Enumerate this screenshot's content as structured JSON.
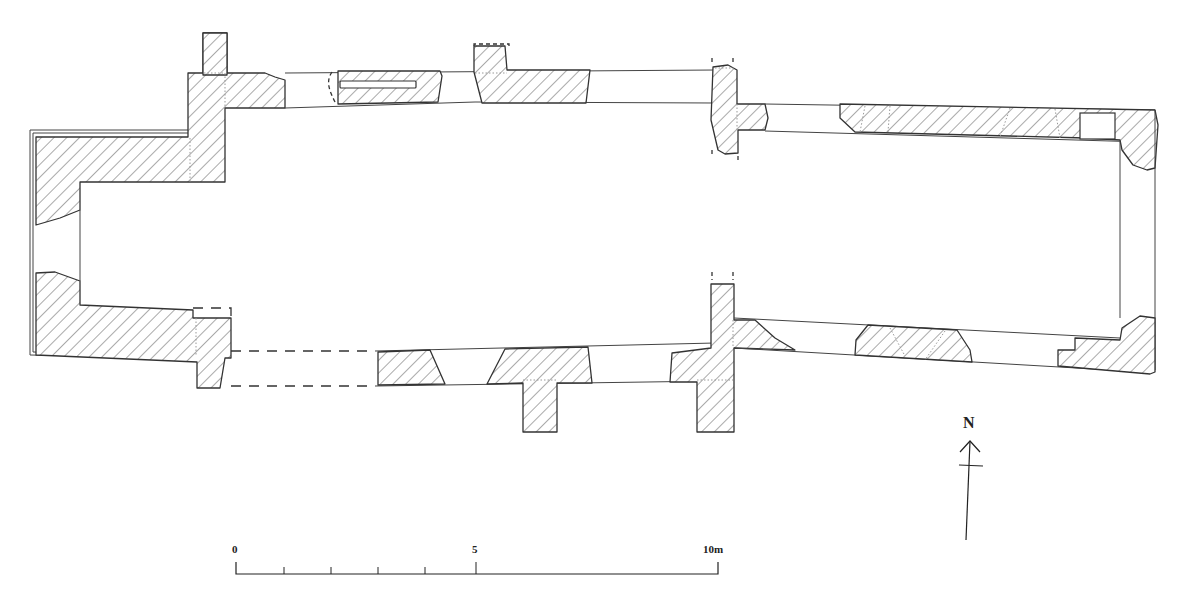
{
  "diagram": {
    "type": "architectural-floor-plan",
    "legend": {
      "hatched": "surviving wall",
      "dashed": "conjectured / robbed wall",
      "dotted": "construction joints"
    }
  },
  "north_arrow": {
    "label": "N"
  },
  "scale_bar": {
    "labels": [
      "0",
      "5",
      "10m"
    ],
    "units": "m",
    "length_m": 10,
    "minor_ticks_m": [
      1,
      2,
      3,
      4
    ]
  },
  "colors": {
    "stroke": "#333333",
    "hatch": "#444444",
    "background": "#ffffff"
  }
}
